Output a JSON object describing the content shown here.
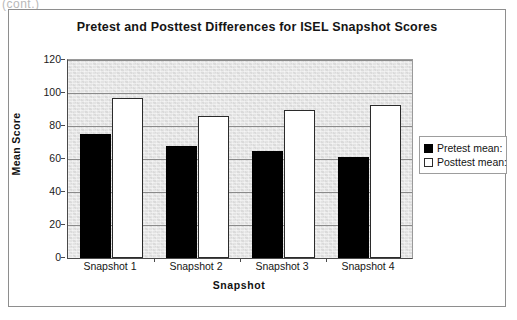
{
  "page": {
    "header_fragment": "(cont.)"
  },
  "chart_data": {
    "type": "bar",
    "title": "Pretest and Posttest Differences for ISEL Snapshot Scores",
    "xlabel": "Snapshot",
    "ylabel": "Mean Score",
    "categories": [
      "Snapshot 1",
      "Snapshot 2",
      "Snapshot 3",
      "Snapshot 4"
    ],
    "series": [
      {
        "name": "Pretest mean:",
        "color": "#000000",
        "values": [
          75,
          68,
          65,
          61
        ]
      },
      {
        "name": "Posttest mean:",
        "color": "#ffffff",
        "values": [
          97,
          86,
          90,
          93
        ]
      }
    ],
    "ylim": [
      0,
      120
    ],
    "ytick_labels": [
      "120",
      "100",
      "80",
      "60",
      "40",
      "20",
      "0"
    ],
    "ytick_values": [
      120,
      100,
      80,
      60,
      40,
      20,
      0
    ],
    "grid": true,
    "legend_position": "right",
    "plot_background": "#e2e2e2"
  }
}
